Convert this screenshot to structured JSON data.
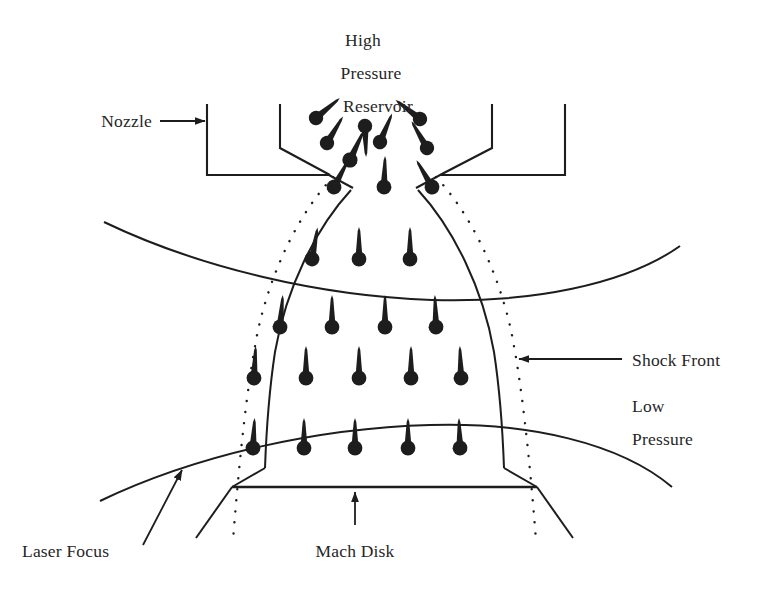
{
  "figure": {
    "background_color": "#ffffff",
    "line_color": "#1d1d1d",
    "text_color": "#262626",
    "particle_color": "#1d1d1d"
  },
  "labels": {
    "high": "High",
    "pressure_top": "Pressure",
    "reservoir": "Reservoir",
    "nozzle": "Nozzle",
    "shock_front": "Shock Front",
    "low": "Low",
    "pressure_right": "Pressure",
    "laser_focus": "Laser Focus",
    "mach_disk": "Mach Disk"
  },
  "regions": [
    {
      "name": "high-pressure-reservoir",
      "label": "High Pressure Reservoir"
    },
    {
      "name": "nozzle-body",
      "label": "Nozzle"
    },
    {
      "name": "zone-of-silence",
      "label": "Zone of silence / barrel shock"
    },
    {
      "name": "mach-disk",
      "label": "Mach Disk"
    },
    {
      "name": "shock-front",
      "label": "Shock Front"
    },
    {
      "name": "low-pressure-chamber",
      "label": "Low Pressure"
    },
    {
      "name": "laser-focus-path",
      "label": "Laser Focus"
    }
  ],
  "leaders": [
    {
      "name": "nozzle-leader",
      "from": "Nozzle",
      "direction": "right"
    },
    {
      "name": "shock-front-leader",
      "from": "Shock Front",
      "direction": "left"
    },
    {
      "name": "laser-focus-leader",
      "from": "Laser Focus",
      "direction": "up-right"
    },
    {
      "name": "mach-disk-leader",
      "from": "Mach Disk",
      "direction": "up"
    }
  ],
  "particles": {
    "reservoir_count": 11,
    "throat_count": 3,
    "plume_row1_count": 3,
    "plume_row2_count": 4,
    "plume_row3_count": 5,
    "plume_row4_count": 5,
    "note": "filled circle with tapered arrow indicating velocity vector"
  }
}
